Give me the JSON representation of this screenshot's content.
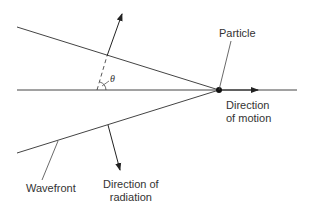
{
  "diagram": {
    "labels": {
      "particle": "Particle",
      "direction_of_motion_line1": "Direction",
      "direction_of_motion_line2": "of motion",
      "wavefront": "Wavefront",
      "direction_of_radiation_line1": "Direction of",
      "direction_of_radiation_line2": "radiation",
      "angle": "θ"
    },
    "colors": {
      "line": "#333333",
      "background": "#ffffff"
    }
  }
}
